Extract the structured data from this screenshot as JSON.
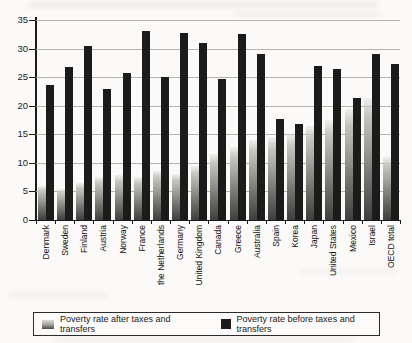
{
  "figure": {
    "background": "#fbfaf8"
  },
  "chart_data": {
    "type": "bar",
    "title": "",
    "xlabel": "",
    "ylabel": "",
    "ylim": [
      0,
      35
    ],
    "yticks": [
      0,
      5,
      10,
      15,
      20,
      25,
      30,
      35
    ],
    "grid": true,
    "legend_position": "bottom",
    "categories": [
      "Denmark",
      "Sweden",
      "Finland",
      "Austria",
      "Norway",
      "France",
      "the Netherlands",
      "Germany",
      "United Kingdom",
      "Canada",
      "Greece",
      "Australia",
      "Spain",
      "Korea",
      "Japan",
      "United States",
      "Mexico",
      "Israel",
      "OECD total"
    ],
    "series": [
      {
        "name": "Poverty rate after taxes and transfers",
        "style": "gray-gradient",
        "color": "#8c8a86",
        "values": [
          6.0,
          5.5,
          6.5,
          7.5,
          7.8,
          7.5,
          8.5,
          8.0,
          9.5,
          11.5,
          12.7,
          14.0,
          14.5,
          15.0,
          16.5,
          17.5,
          19.5,
          21.3,
          11.0
        ]
      },
      {
        "name": "Poverty rate before taxes and transfers",
        "style": "solid-black",
        "color": "#1b1b1b",
        "values": [
          23.6,
          26.7,
          30.4,
          23.0,
          25.8,
          33.0,
          25.1,
          32.8,
          31.0,
          24.7,
          32.5,
          29.0,
          17.7,
          16.8,
          27.0,
          26.4,
          21.3,
          29.1,
          27.3
        ]
      }
    ]
  },
  "legend": {
    "after_label": "Poverty rate after taxes and transfers",
    "before_label": "Poverty rate before taxes and transfers"
  }
}
